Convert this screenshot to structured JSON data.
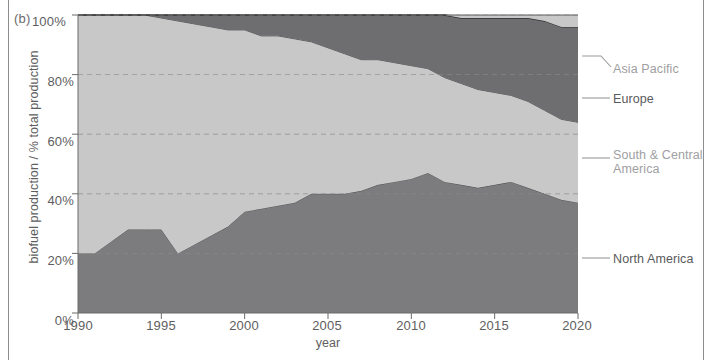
{
  "panel": {
    "label": "(b)"
  },
  "axes": {
    "ylabel": "biofuel production / % total production",
    "xlabel": "year",
    "yticks": [
      "0%",
      "20%",
      "40%",
      "60%",
      "80%",
      "100%"
    ],
    "xticks": [
      "1990",
      "1995",
      "2000",
      "2005",
      "2010",
      "2015",
      "2020"
    ]
  },
  "legend": {
    "items": [
      {
        "label": "Asia Pacific",
        "color": "#c8c8c8"
      },
      {
        "label": "Europe",
        "color": "#6e6e70"
      },
      {
        "label": "South & Central America",
        "color": "#c8c8c8"
      },
      {
        "label": "North America",
        "color": "#7c7c7e"
      }
    ]
  },
  "chart_data": {
    "type": "area",
    "stacked": true,
    "title": "",
    "xlabel": "year",
    "ylabel": "biofuel production / % total production",
    "xlim": [
      1990,
      2020
    ],
    "ylim": [
      0,
      100
    ],
    "grid": true,
    "grid_style": "dashed-horizontal",
    "legend_position": "right",
    "x": [
      1990,
      1991,
      1992,
      1993,
      1994,
      1995,
      1996,
      1997,
      1998,
      1999,
      2000,
      2001,
      2002,
      2003,
      2004,
      2005,
      2006,
      2007,
      2008,
      2009,
      2010,
      2011,
      2012,
      2013,
      2014,
      2015,
      2016,
      2017,
      2018,
      2019,
      2020
    ],
    "series": [
      {
        "name": "North America",
        "color": "#7c7c7e",
        "values": [
          20,
          20,
          24,
          28,
          28,
          28,
          20,
          23,
          26,
          29,
          34,
          35,
          36,
          37,
          40,
          40,
          40,
          41,
          43,
          44,
          45,
          47,
          44,
          43,
          42,
          43,
          44,
          42,
          40,
          38,
          37
        ]
      },
      {
        "name": "South & Central America",
        "color": "#c8c8c8",
        "values": [
          80,
          80,
          76,
          72,
          72,
          71,
          78,
          74,
          70,
          66,
          61,
          58,
          57,
          55,
          51,
          49,
          47,
          44,
          42,
          40,
          38,
          35,
          35,
          34,
          33,
          31,
          29,
          29,
          28,
          27,
          27
        ]
      },
      {
        "name": "Europe",
        "color": "#6e6e70",
        "values": [
          0,
          0,
          0,
          0,
          0,
          1,
          2,
          3,
          4,
          5,
          5,
          7,
          7,
          8,
          9,
          11,
          13,
          15,
          15,
          16,
          17,
          18,
          21,
          22,
          24,
          25,
          26,
          28,
          30,
          31,
          32
        ]
      },
      {
        "name": "Asia Pacific",
        "color": "#c8c8c8",
        "values": [
          0,
          0,
          0,
          0,
          0,
          0,
          0,
          0,
          0,
          0,
          0,
          0,
          0,
          0,
          0,
          0,
          0,
          0,
          0,
          0,
          0,
          0,
          0,
          1,
          1,
          1,
          1,
          1,
          2,
          4,
          4
        ]
      }
    ],
    "cumulative_top_boundaries": {
      "north_america": [
        20,
        20,
        24,
        28,
        28,
        28,
        20,
        23,
        26,
        29,
        34,
        35,
        36,
        37,
        40,
        40,
        40,
        41,
        43,
        44,
        45,
        47,
        44,
        43,
        42,
        43,
        44,
        42,
        40,
        38,
        37
      ],
      "plus_south_central": [
        100,
        100,
        100,
        100,
        100,
        99,
        98,
        97,
        96,
        95,
        95,
        93,
        93,
        92,
        91,
        89,
        87,
        85,
        85,
        84,
        83,
        82,
        79,
        77,
        75,
        74,
        73,
        71,
        68,
        65,
        64
      ],
      "plus_europe": [
        100,
        100,
        100,
        100,
        100,
        100,
        100,
        100,
        100,
        100,
        100,
        100,
        100,
        100,
        100,
        100,
        100,
        100,
        100,
        100,
        100,
        100,
        100,
        99,
        99,
        99,
        99,
        99,
        98,
        96,
        96
      ]
    }
  }
}
